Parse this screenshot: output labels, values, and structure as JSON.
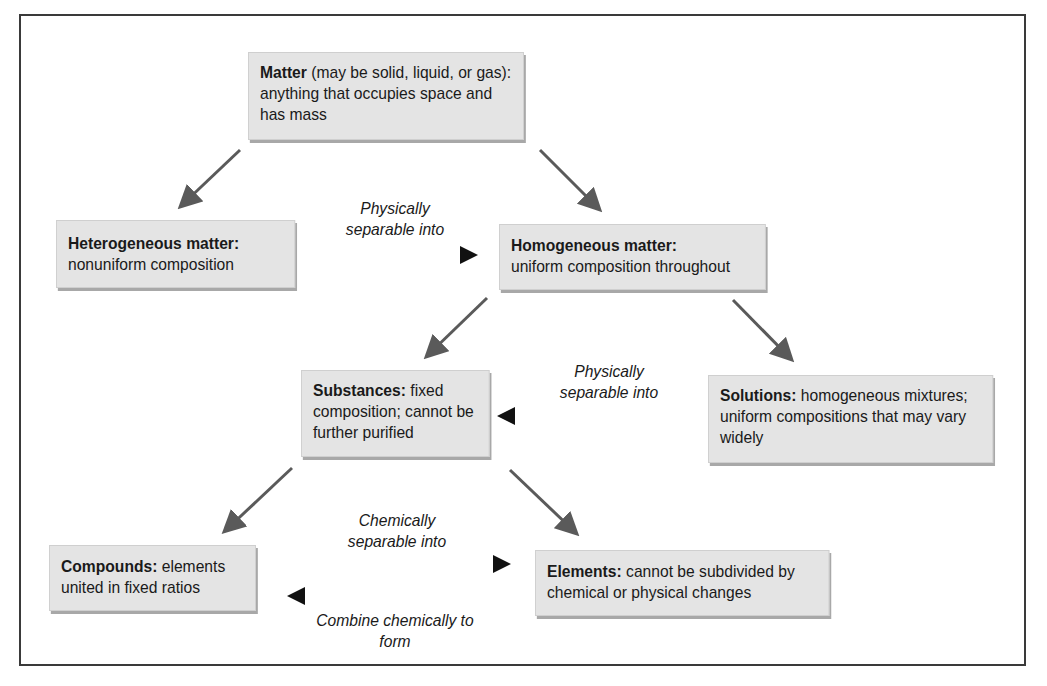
{
  "diagram": {
    "nodes": {
      "matter": {
        "bold": "Matter",
        "text": " (may be solid, liquid, or gas): anything that occupies space and has mass"
      },
      "heterogeneous": {
        "bold": "Heterogeneous matter:",
        "text": " nonuniform composition"
      },
      "homogeneous": {
        "bold": "Homogeneous matter:",
        "text": " uniform composition throughout"
      },
      "substances": {
        "bold": "Substances:",
        "text": " fixed composition; cannot be further purified"
      },
      "solutions": {
        "bold": "Solutions:",
        "text": " homogeneous mixtures; uniform compositions that may vary widely"
      },
      "compounds": {
        "bold": "Compounds:",
        "text": " elements united in fixed ratios"
      },
      "elements": {
        "bold": "Elements:",
        "text": " cannot be subdivided by chemical or physical changes"
      }
    },
    "edge_labels": {
      "het_to_hom": "Physically separable into",
      "sol_to_sub": "Physically separable into",
      "comp_to_elem": "Chemically separable into",
      "elem_to_comp": "Combine chemically to form"
    },
    "colors": {
      "box_fill": "#e4e4e4",
      "box_shadow": "#a8a8a8",
      "arrow_gray": "#5a5a5a",
      "arrow_black": "#111111"
    }
  }
}
